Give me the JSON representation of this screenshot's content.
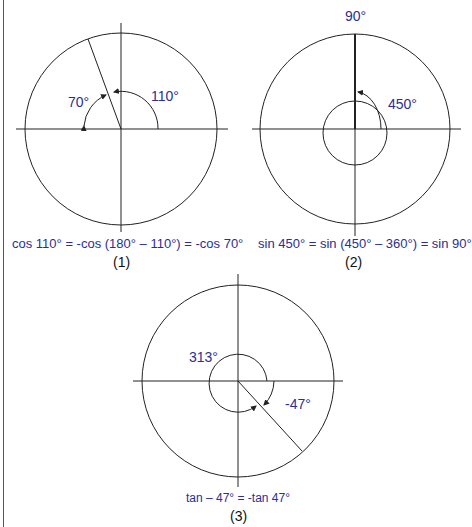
{
  "colors": {
    "label": "#2b2f8f",
    "line": "#222222",
    "caption": "#111111"
  },
  "diagrams": [
    {
      "id": 1,
      "angle_labels": {
        "a": "70°",
        "b": "110°"
      },
      "equation": "cos 110° = -cos (180° – 110°) = -cos 70°",
      "caption": "(1)"
    },
    {
      "id": 2,
      "angle_labels": {
        "top": "90°",
        "a": "450°"
      },
      "equation": "sin 450° = sin (450° – 360°) = sin 90°",
      "caption": "(2)"
    },
    {
      "id": 3,
      "angle_labels": {
        "a": "313°",
        "b": "-47°"
      },
      "equation": "tan – 47° = -tan 47°",
      "caption": "(3)"
    }
  ]
}
